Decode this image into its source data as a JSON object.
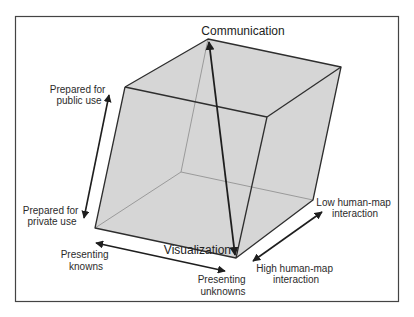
{
  "diagram": {
    "type": "cube-space",
    "colors": {
      "face": "#d6d6d6",
      "edge": "#2e2e2e",
      "hidden_edge": "#8a8a8a",
      "arrow": "#1e1e1e",
      "frame": "#444444"
    },
    "vertices": {
      "communication": "Communication",
      "visualization": "Visualization"
    },
    "axes": {
      "vertical": {
        "top": [
          "Prepared for",
          "public use"
        ],
        "bottom": [
          "Prepared for",
          "private use"
        ]
      },
      "horizontal": {
        "left": [
          "Presenting",
          "knowns"
        ],
        "right": [
          "Presenting",
          "unknowns"
        ]
      },
      "depth": {
        "far": [
          "Low human-map",
          "interaction"
        ],
        "near": [
          "High human-map",
          "interaction"
        ]
      }
    }
  }
}
